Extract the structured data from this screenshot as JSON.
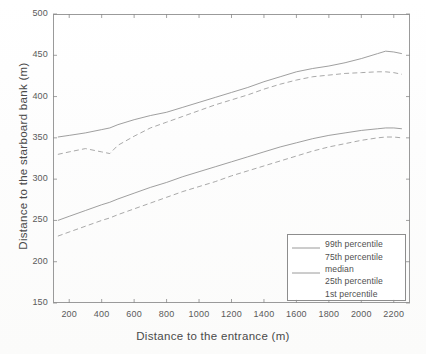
{
  "figure": {
    "background_color": "#fdfdfc",
    "line_color": "#8e8e8e",
    "axis_color": "#9a9a9a"
  },
  "axes": {
    "x_title": "Distance to the entrance (m)",
    "y_title": "Distance to the starboard bank (m)",
    "x_ticks": [
      "200",
      "400",
      "600",
      "800",
      "1000",
      "1200",
      "1400",
      "1600",
      "1800",
      "2000",
      "2200"
    ],
    "y_ticks": [
      "500",
      "450",
      "400",
      "350",
      "300",
      "250",
      "200",
      "150"
    ]
  },
  "legend": {
    "items": [
      {
        "label": "99th percentile",
        "style": "solid"
      },
      {
        "label": "75th percentile",
        "style": "dashed"
      },
      {
        "label": "median",
        "style": "solid"
      },
      {
        "label": "25th percentile",
        "style": "dashed"
      },
      {
        "label": "1st percentile",
        "style": "dashed"
      }
    ]
  },
  "chart_data": {
    "type": "line",
    "title": "",
    "xlabel": "Distance to the entrance (m)",
    "ylabel": "Distance to the starboard bank (m)",
    "xlim": [
      100,
      2300
    ],
    "ylim": [
      150,
      500
    ],
    "xticks": [
      200,
      400,
      600,
      800,
      1000,
      1200,
      1400,
      1600,
      1800,
      2000,
      2200
    ],
    "yticks": [
      150,
      200,
      250,
      300,
      350,
      400,
      450,
      500
    ],
    "grid": false,
    "legend_position": "lower right",
    "x": [
      130,
      200,
      300,
      400,
      450,
      500,
      600,
      700,
      800,
      900,
      1000,
      1100,
      1200,
      1300,
      1400,
      1500,
      1600,
      1700,
      1800,
      1900,
      2000,
      2100,
      2150,
      2200,
      2250
    ],
    "series": [
      {
        "name": "99th percentile",
        "style": "solid",
        "values": [
          351,
          353,
          356,
          360,
          362,
          366,
          372,
          377,
          381,
          387,
          393,
          399,
          405,
          411,
          418,
          424,
          430,
          434,
          437,
          441,
          446,
          452,
          455,
          454,
          452
        ]
      },
      {
        "name": "75th percentile",
        "style": "dashed",
        "values": [
          330,
          333,
          337,
          333,
          331,
          341,
          352,
          362,
          369,
          376,
          383,
          390,
          396,
          402,
          409,
          415,
          420,
          424,
          426,
          428,
          429,
          430,
          430,
          429,
          427
        ]
      },
      {
        "name": "median",
        "style": "solid",
        "values": [
          null,
          null,
          null,
          null,
          null,
          null,
          null,
          null,
          null,
          null,
          null,
          null,
          null,
          null,
          null,
          null,
          null,
          null,
          null,
          null,
          null,
          null,
          null,
          null,
          null
        ]
      },
      {
        "name": "25th percentile",
        "style": "solid",
        "values": [
          250,
          255,
          262,
          269,
          272,
          276,
          283,
          290,
          296,
          303,
          309,
          315,
          321,
          327,
          333,
          339,
          344,
          349,
          353,
          356,
          359,
          361,
          362,
          362,
          361
        ]
      },
      {
        "name": "1st percentile",
        "style": "dashed",
        "values": [
          231,
          236,
          243,
          250,
          253,
          257,
          264,
          271,
          278,
          285,
          291,
          297,
          304,
          310,
          316,
          322,
          328,
          334,
          339,
          343,
          347,
          350,
          351,
          351,
          350
        ]
      }
    ]
  }
}
